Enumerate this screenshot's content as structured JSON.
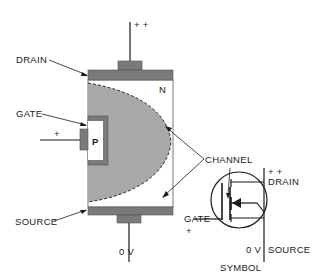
{
  "diagram": {
    "labels": {
      "drain": "DRAIN",
      "gate": "GATE",
      "source": "SOURCE",
      "channel": "CHANNEL",
      "n_region": "N",
      "p_region": "P",
      "drain_voltage": "+ +",
      "gate_polarity": "+",
      "source_voltage": "0 V"
    },
    "symbol": {
      "title": "SYMBOL",
      "drain_voltage": "+ +",
      "drain": "DRAIN",
      "gate": "GATE",
      "gate_polarity": "+",
      "source_voltage": "0 V",
      "source": "SOURCE"
    },
    "colors": {
      "body_fill": "#a8a8a8",
      "contact_fill": "#7a7a7a",
      "n_region_fill": "#ffffff",
      "outline": "#1a1a1a"
    }
  }
}
